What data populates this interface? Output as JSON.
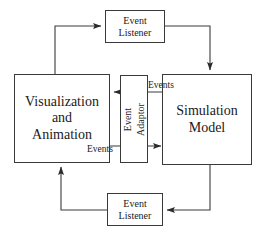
{
  "diagram": {
    "type": "block-flow-diagram",
    "background_color": "#ffffff",
    "line_color": "#3a3a3a",
    "text_color": "#1a1a1a",
    "nodes": {
      "visualization": {
        "label": "Visualization\nand\nAnimation"
      },
      "simulation": {
        "label": "Simulation\nModel"
      },
      "event_adaptor": {
        "label": "Event\nAdaptor",
        "orientation": "vertical-rotated-90-ccw"
      },
      "listener_top": {
        "label": "Event\nListener"
      },
      "listener_bottom": {
        "label": "Event\nListener"
      }
    },
    "edge_labels": {
      "events_to_visualization": "Events",
      "events_to_simulation": "Events"
    },
    "connections": [
      {
        "from": "visualization",
        "to": "listener_top",
        "direction": "right",
        "path": "top-left-loop"
      },
      {
        "from": "listener_top",
        "to": "simulation",
        "direction": "down",
        "path": "top-right-loop"
      },
      {
        "from": "simulation",
        "to": "visualization",
        "direction": "left",
        "label": "Events",
        "path": "through-event-adaptor-upper"
      },
      {
        "from": "visualization",
        "to": "simulation",
        "direction": "right",
        "label": "Events",
        "path": "through-event-adaptor-lower"
      },
      {
        "from": "simulation",
        "to": "listener_bottom",
        "direction": "left",
        "path": "bottom-right-loop"
      },
      {
        "from": "listener_bottom",
        "to": "visualization",
        "direction": "up",
        "path": "bottom-left-loop"
      }
    ]
  }
}
